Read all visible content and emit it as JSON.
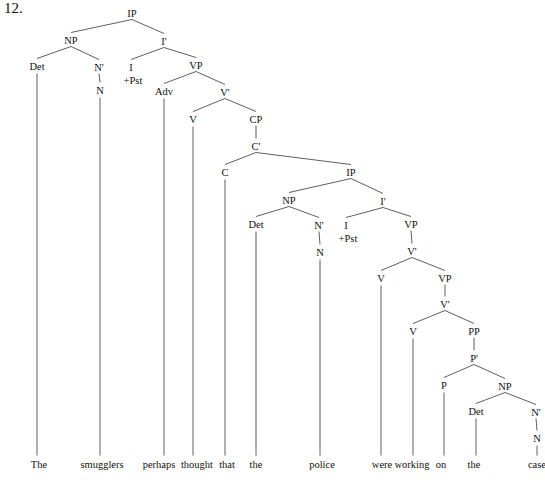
{
  "figure": {
    "item_number": "12."
  },
  "colors": {
    "background": "#ffffff",
    "text": "#111111",
    "line": "#4d4d4d"
  },
  "tree": {
    "terminal_y": 464,
    "nodes": [
      {
        "id": "ip1",
        "label": "IP",
        "x": 132,
        "y": 13
      },
      {
        "id": "np1",
        "label": "NP",
        "x": 71,
        "y": 40
      },
      {
        "id": "ibar1",
        "label": "I'",
        "x": 164,
        "y": 41
      },
      {
        "id": "det1",
        "label": "Det",
        "x": 37,
        "y": 66
      },
      {
        "id": "nbar1",
        "label": "N'",
        "x": 99,
        "y": 67
      },
      {
        "id": "i1",
        "label": "I",
        "x": 131,
        "y": 67,
        "sub": "+Pst"
      },
      {
        "id": "vp1",
        "label": "VP",
        "x": 196,
        "y": 65
      },
      {
        "id": "n1",
        "label": "N",
        "x": 100,
        "y": 90
      },
      {
        "id": "adv1",
        "label": "Adv",
        "x": 164,
        "y": 91
      },
      {
        "id": "vbar1",
        "label": "V'",
        "x": 225,
        "y": 92
      },
      {
        "id": "v1",
        "label": "V",
        "x": 193,
        "y": 119
      },
      {
        "id": "cp1",
        "label": "CP",
        "x": 256,
        "y": 119
      },
      {
        "id": "cbar1",
        "label": "C'",
        "x": 256,
        "y": 146
      },
      {
        "id": "c1",
        "label": "C",
        "x": 225,
        "y": 172
      },
      {
        "id": "ip2",
        "label": "IP",
        "x": 351,
        "y": 172
      },
      {
        "id": "np2",
        "label": "NP",
        "x": 289,
        "y": 200
      },
      {
        "id": "ibar2",
        "label": "I'",
        "x": 383,
        "y": 201
      },
      {
        "id": "det2",
        "label": "Det",
        "x": 256,
        "y": 224
      },
      {
        "id": "nbar2",
        "label": "N'",
        "x": 319,
        "y": 225
      },
      {
        "id": "i2",
        "label": "I",
        "x": 346,
        "y": 225,
        "sub": "+Pst"
      },
      {
        "id": "vp2",
        "label": "VP",
        "x": 411,
        "y": 224
      },
      {
        "id": "n2",
        "label": "N",
        "x": 320,
        "y": 252
      },
      {
        "id": "vbar2",
        "label": "V'",
        "x": 412,
        "y": 251
      },
      {
        "id": "v2",
        "label": "V",
        "x": 381,
        "y": 278
      },
      {
        "id": "vp3",
        "label": "VP",
        "x": 445,
        "y": 278
      },
      {
        "id": "vbar3",
        "label": "V'",
        "x": 445,
        "y": 304
      },
      {
        "id": "v3",
        "label": "V",
        "x": 413,
        "y": 331
      },
      {
        "id": "pp1",
        "label": "PP",
        "x": 474,
        "y": 331
      },
      {
        "id": "pbar1",
        "label": "P'",
        "x": 474,
        "y": 358
      },
      {
        "id": "p1",
        "label": "P",
        "x": 444,
        "y": 385
      },
      {
        "id": "np3",
        "label": "NP",
        "x": 505,
        "y": 386
      },
      {
        "id": "det3",
        "label": "Det",
        "x": 476,
        "y": 411
      },
      {
        "id": "nbar3",
        "label": "N'",
        "x": 536,
        "y": 412
      },
      {
        "id": "n3",
        "label": "N",
        "x": 537,
        "y": 438
      }
    ],
    "edges": [
      [
        "ip1",
        "np1"
      ],
      [
        "ip1",
        "ibar1"
      ],
      [
        "np1",
        "det1"
      ],
      [
        "np1",
        "nbar1"
      ],
      [
        "ibar1",
        "i1"
      ],
      [
        "ibar1",
        "vp1"
      ],
      [
        "nbar1",
        "n1"
      ],
      [
        "vp1",
        "adv1"
      ],
      [
        "vp1",
        "vbar1"
      ],
      [
        "vbar1",
        "v1"
      ],
      [
        "vbar1",
        "cp1"
      ],
      [
        "cp1",
        "cbar1"
      ],
      [
        "cbar1",
        "c1"
      ],
      [
        "cbar1",
        "ip2"
      ],
      [
        "ip2",
        "np2"
      ],
      [
        "ip2",
        "ibar2"
      ],
      [
        "np2",
        "det2"
      ],
      [
        "np2",
        "nbar2"
      ],
      [
        "nbar2",
        "n2"
      ],
      [
        "ibar2",
        "i2"
      ],
      [
        "ibar2",
        "vp2"
      ],
      [
        "vp2",
        "vbar2"
      ],
      [
        "vbar2",
        "v2"
      ],
      [
        "vbar2",
        "vp3"
      ],
      [
        "vp3",
        "vbar3"
      ],
      [
        "vbar3",
        "v3"
      ],
      [
        "vbar3",
        "pp1"
      ],
      [
        "pp1",
        "pbar1"
      ],
      [
        "pbar1",
        "p1"
      ],
      [
        "pbar1",
        "np3"
      ],
      [
        "np3",
        "det3"
      ],
      [
        "np3",
        "nbar3"
      ],
      [
        "nbar3",
        "n3"
      ]
    ],
    "terminals": [
      {
        "word": "The",
        "x": 39,
        "under": "det1"
      },
      {
        "word": "smugglers",
        "x": 102,
        "under": "n1"
      },
      {
        "word": "perhaps",
        "x": 159,
        "under": "adv1"
      },
      {
        "word": "thought",
        "x": 197,
        "under": "v1"
      },
      {
        "word": "that",
        "x": 227,
        "under": "c1"
      },
      {
        "word": "the",
        "x": 256,
        "under": "det2"
      },
      {
        "word": "police",
        "x": 322,
        "under": "n2"
      },
      {
        "word": "were",
        "x": 382,
        "under": "v2"
      },
      {
        "word": "working",
        "x": 412,
        "under": "v3"
      },
      {
        "word": "on",
        "x": 441,
        "under": "p1"
      },
      {
        "word": "the",
        "x": 474,
        "under": "det3"
      },
      {
        "word": "case",
        "x": 537,
        "under": "n3"
      }
    ]
  }
}
